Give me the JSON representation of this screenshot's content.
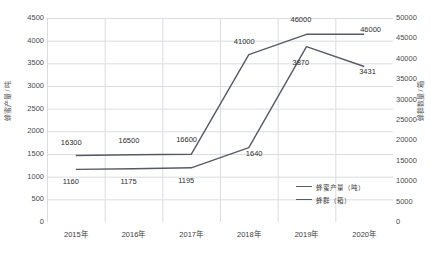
{
  "chart_data": {
    "type": "line",
    "title": "",
    "xlabel": "",
    "ylabel": "蜂蜜产量 / 吨",
    "y2label": "蜂群数量 / 箱",
    "categories": [
      "2015年",
      "2016年",
      "2017年",
      "2018年",
      "2019年",
      "2020年"
    ],
    "grid": true,
    "legend_position": "inside-bottom-right",
    "ylim": [
      0,
      4500
    ],
    "y2lim": [
      0,
      50000
    ],
    "yticks": [
      "0",
      "500",
      "1000",
      "1500",
      "2000",
      "2500",
      "3000",
      "3500",
      "4000",
      "4500"
    ],
    "y2ticks": [
      "0",
      "5000",
      "10000",
      "15000",
      "20000",
      "25000",
      "30000",
      "35000",
      "40000",
      "45000",
      "50000"
    ],
    "series": [
      {
        "name": "蜂蜜产量（吨）",
        "axis": "left",
        "color": "#555b66",
        "values": [
          1160,
          1175,
          1195,
          1640,
          3870,
          3431
        ],
        "labels": [
          "1160",
          "1175",
          "1195",
          "1640",
          "3870",
          "3431"
        ]
      },
      {
        "name": "蜂群（箱）",
        "axis": "right",
        "color": "#555b66",
        "values": [
          16300,
          16500,
          16600,
          41000,
          46000,
          46000
        ],
        "labels": [
          "16300",
          "16500",
          "16600",
          "41000",
          "46000",
          "46000"
        ]
      }
    ]
  },
  "legend": {
    "items": [
      {
        "label": "蜂蜜产量（吨）"
      },
      {
        "label": "蜂群（箱）"
      }
    ]
  }
}
